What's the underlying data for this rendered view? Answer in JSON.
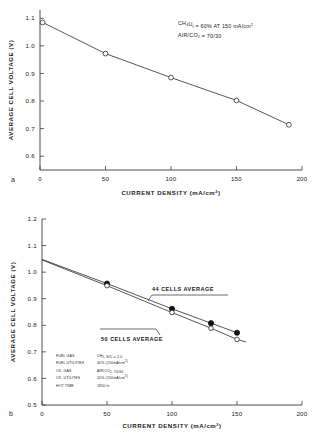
{
  "figure": {
    "panel_a_letter": "a",
    "panel_b_letter": "b"
  },
  "chart_data": [
    {
      "id": "panel-a",
      "type": "line",
      "title": "",
      "xlabel": "CURRENT DENSITY (mA/cm",
      "xlabel_sup": "2",
      "xlabel_close": ")",
      "ylabel": "AVERAGE CELL VOLTAGE (V)",
      "xlim": [
        0,
        200
      ],
      "ylim": [
        0.55,
        1.13
      ],
      "xticks": [
        0,
        50,
        100,
        150,
        200
      ],
      "xticklabels": [
        "0",
        "50",
        "100",
        "150",
        "200"
      ],
      "yticks": [
        0.6,
        0.7,
        0.8,
        0.9,
        1.0,
        1.1
      ],
      "yticklabels": [
        "0.6",
        "0.7",
        "0.8",
        "0.9",
        "1.0",
        "1.1"
      ],
      "grid": false,
      "legend": "none",
      "series": [
        {
          "name": "single cell",
          "marker": "open-circle",
          "x": [
            2,
            50,
            100,
            150,
            190
          ],
          "y": [
            1.085,
            0.972,
            0.885,
            0.802,
            0.714
          ]
        }
      ],
      "annotations": [
        {
          "id": "fuel-utilization",
          "parts": [
            {
              "t": "CH",
              "s": "normal"
            },
            {
              "t": "4",
              "s": "sub"
            },
            {
              "t": "U",
              "s": "normal"
            },
            {
              "t": "f",
              "s": "sub"
            },
            {
              "t": "  = 60% AT 150 mA/cm",
              "s": "normal"
            },
            {
              "t": "2",
              "s": "sup"
            }
          ],
          "plain": "CH4Uf = 60% AT 150 mA/cm2"
        },
        {
          "id": "oxidant-ratio",
          "parts": [
            {
              "t": "AIR/CO",
              "s": "normal"
            },
            {
              "t": "2",
              "s": "sub"
            },
            {
              "t": " = 70/30",
              "s": "normal"
            }
          ],
          "plain": "AIR/CO2 = 70/30"
        }
      ]
    },
    {
      "id": "panel-b",
      "type": "line",
      "title": "",
      "xlabel": "CURRENT DENSITY (mA/cm",
      "xlabel_sup": "2",
      "xlabel_close": ")",
      "ylabel": "AVERAGE CELL VOLTAGE (V)",
      "xlim": [
        0,
        200
      ],
      "ylim": [
        0.5,
        1.2
      ],
      "xticks": [
        0,
        50,
        100,
        150,
        200
      ],
      "xticklabels": [
        "0",
        "50",
        "100",
        "150",
        "200"
      ],
      "yticks": [
        0.5,
        0.6,
        0.7,
        0.8,
        0.9,
        1.0,
        1.1,
        1.2
      ],
      "yticklabels": [
        "0.5",
        "0.6",
        "0.7",
        "0.8",
        "0.9",
        "1.0",
        "1.1",
        "1.2"
      ],
      "grid": false,
      "legend": "callout",
      "series": [
        {
          "name": "44 CELLS AVERAGE",
          "marker": "filled-circle",
          "x": [
            0,
            50,
            100,
            130,
            150
          ],
          "y": [
            1.048,
            0.957,
            0.862,
            0.808,
            0.772
          ]
        },
        {
          "name": "50 CELLS AVERAGE",
          "marker": "open-circle",
          "x": [
            0,
            50,
            100,
            130,
            150,
            157
          ],
          "y": [
            1.046,
            0.949,
            0.848,
            0.789,
            0.747,
            0.737
          ]
        }
      ],
      "series_labels": [
        {
          "id": "label-44-cells",
          "text": "44 CELLS AVERAGE"
        },
        {
          "id": "label-50-cells",
          "text": "50 CELLS AVERAGE"
        }
      ],
      "parameter_table": {
        "rows": [
          {
            "key": "FUEL GAS",
            "parts": [
              {
                "t": "CH",
                "s": "normal"
              },
              {
                "t": "4",
                "s": "sub"
              },
              {
                "t": ", S/C  =  2.0",
                "s": "normal"
              }
            ],
            "plain": "CH4, S/C = 2.0"
          },
          {
            "key": "FUEL UTILITIES",
            "parts": [
              {
                "t": "40% (150mA/cm",
                "s": "normal"
              },
              {
                "t": "2",
                "s": "sup"
              },
              {
                "t": ")",
                "s": "normal"
              }
            ],
            "plain": "40% (150mA/cm2)"
          },
          {
            "key": "OX. GAS",
            "parts": [
              {
                "t": "AIR/CO",
                "s": "normal"
              },
              {
                "t": "2",
                "s": "sub"
              },
              {
                "t": ",  70/30",
                "s": "normal"
              }
            ],
            "plain": "AIR/CO2, 70/30"
          },
          {
            "key": "OX. UTILITES",
            "parts": [
              {
                "t": "20% (150mA/cm",
                "s": "normal"
              },
              {
                "t": "2",
                "s": "sup"
              },
              {
                "t": ")",
                "s": "normal"
              }
            ],
            "plain": "20% (150mA/cm2)"
          },
          {
            "key": "HOT TIME",
            "parts": [
              {
                "t": "1850 hr",
                "s": "normal"
              }
            ],
            "plain": "1850 hr"
          }
        ]
      }
    }
  ]
}
